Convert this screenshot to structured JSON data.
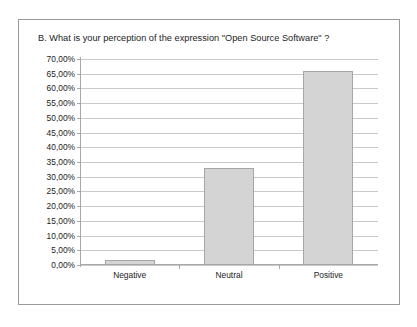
{
  "figure": {
    "border_color": "#9a9a9a",
    "background": "#ffffff"
  },
  "chart_data": {
    "type": "bar",
    "title": "B. What is your perception of the expression \"Open Source Software\" ?",
    "xlabel": "",
    "ylabel": "",
    "categories": [
      "Negative",
      "Neutral",
      "Positive"
    ],
    "values": [
      1.6,
      33.0,
      66.0
    ],
    "value_labels": [
      "1,60%",
      "33,00%",
      "66,00%"
    ],
    "ylim": [
      0,
      70
    ],
    "ytick_step": 5,
    "ytick_labels": [
      "70,00%",
      "65,00%",
      "60,00%",
      "55,00%",
      "50,00%",
      "45,00%",
      "40,00%",
      "35,00%",
      "30,00%",
      "25,00%",
      "20,00%",
      "15,00%",
      "10,00%",
      "5,00%",
      "0,00%"
    ],
    "ytick_values": [
      70,
      65,
      60,
      55,
      50,
      45,
      40,
      35,
      30,
      25,
      20,
      15,
      10,
      5,
      0
    ],
    "grid": true,
    "grid_axis": "y",
    "grid_color": "#c9c9c9",
    "legend": false,
    "legend_position": "none",
    "bar_fill": "#d4d4d4",
    "bar_edge": "#a6a6a6",
    "axis_color": "#a8a8a8",
    "text_color": "#1c1c1c"
  }
}
